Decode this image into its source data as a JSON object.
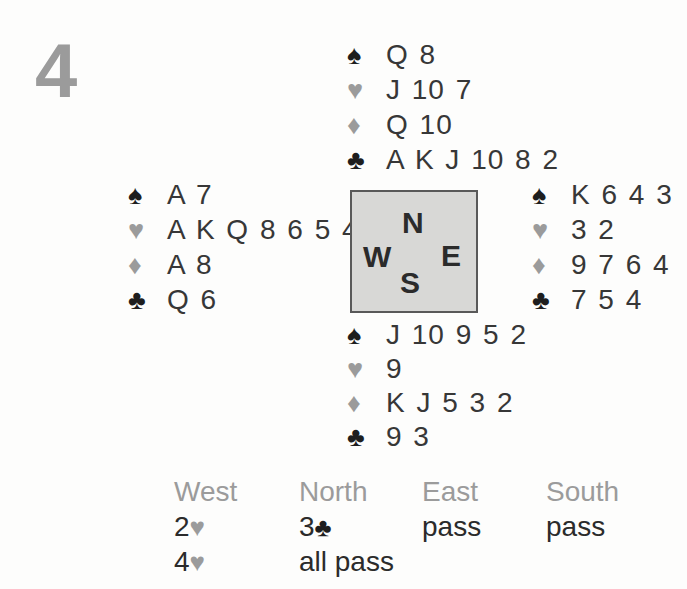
{
  "deal_number": "4",
  "suit_symbols": {
    "spade": "♠",
    "heart": "♥",
    "diamond": "♦",
    "club": "♣"
  },
  "hands": {
    "north": {
      "spades": "Q 8",
      "hearts": "J 10 7",
      "diamonds": "Q 10",
      "clubs": "A K J 10 8 2"
    },
    "west": {
      "spades": "A 7",
      "hearts": "A K Q 8 6 5 4",
      "diamonds": "A 8",
      "clubs": "Q 6"
    },
    "east": {
      "spades": "K 6 4 3",
      "hearts": "3 2",
      "diamonds": "9 7 6 4",
      "clubs": "7 5 4"
    },
    "south": {
      "spades": "J 10 9 5 2",
      "hearts": "9",
      "diamonds": "K J 5 3 2",
      "clubs": "9 3"
    }
  },
  "compass": {
    "north": "N",
    "west": "W",
    "east": "E",
    "south": "S"
  },
  "auction": {
    "headers": [
      "West",
      "North",
      "East",
      "South"
    ],
    "bids": {
      "west": [
        {
          "rank": "2",
          "suit": "♥"
        },
        {
          "rank": "4",
          "suit": "♥"
        }
      ],
      "north": [
        {
          "rank": "3",
          "suit": "♣"
        },
        {
          "rank": "all pass",
          "suit": ""
        }
      ],
      "east": [
        {
          "rank": "pass",
          "suit": ""
        }
      ],
      "south": [
        {
          "rank": "pass",
          "suit": ""
        }
      ]
    }
  },
  "colors": {
    "gray_accent": "#9b9b9b",
    "text_dark": "#373737",
    "suit_black": "#1e1e1e",
    "compass_background": "#d8d8d6",
    "compass_border": "#595959",
    "page_background": "#fdfdfc"
  }
}
